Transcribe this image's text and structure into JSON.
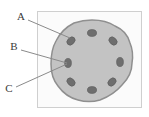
{
  "figure": {
    "canvas": {
      "width": 149,
      "height": 117,
      "background": "#ffffff"
    },
    "frame": {
      "name": "outer-frame",
      "x": 37,
      "y": 11,
      "width": 105,
      "height": 97,
      "fill": "#fbfbfb",
      "stroke": "#cfcfcf",
      "stroke_width": 1
    },
    "body": {
      "name": "main-circle",
      "cx": 92,
      "cy": 61,
      "r": 41,
      "fill": "#c3c3c3",
      "stroke": "#8f8f8f",
      "stroke_width": 1.5,
      "outline_style": "scalloped"
    },
    "granules": {
      "name": "inner-granules",
      "count": 8,
      "fill": "#6e6e6e",
      "stroke": "#5a5a5a",
      "rx": 4.6,
      "ry": 3.4,
      "items": [
        {
          "id": "granule-1",
          "cx": 92,
          "cy": 33,
          "rotate": 0
        },
        {
          "id": "granule-2",
          "cx": 113,
          "cy": 41,
          "rotate": 45
        },
        {
          "id": "granule-3",
          "cx": 120,
          "cy": 62,
          "rotate": 90
        },
        {
          "id": "granule-4",
          "cx": 112,
          "cy": 82,
          "rotate": 135
        },
        {
          "id": "granule-5",
          "cx": 92,
          "cy": 90,
          "rotate": 0
        },
        {
          "id": "granule-6",
          "cx": 71,
          "cy": 82,
          "rotate": 45
        },
        {
          "id": "granule-7",
          "cx": 68,
          "cy": 63,
          "rotate": 90
        },
        {
          "id": "granule-8",
          "cx": 71,
          "cy": 41,
          "rotate": 135
        }
      ]
    },
    "labels": [
      {
        "id": "label-a",
        "text": "A",
        "text_x": 21,
        "text_y": 17,
        "leader": {
          "x1": 28,
          "y1": 20,
          "x2": 70,
          "y2": 38
        },
        "points_to": "main-circle-margin"
      },
      {
        "id": "label-b",
        "text": "B",
        "text_x": 14,
        "text_y": 47,
        "leader": {
          "x1": 21,
          "y1": 50,
          "x2": 67,
          "y2": 63
        },
        "points_to": "granule-7"
      },
      {
        "id": "label-c",
        "text": "C",
        "text_x": 9,
        "text_y": 89,
        "leader": {
          "x1": 16,
          "y1": 87,
          "x2": 67,
          "y2": 64
        },
        "points_to": "granule-7"
      }
    ],
    "leader_style": {
      "stroke": "#8a8a8a",
      "stroke_width": 1
    }
  }
}
